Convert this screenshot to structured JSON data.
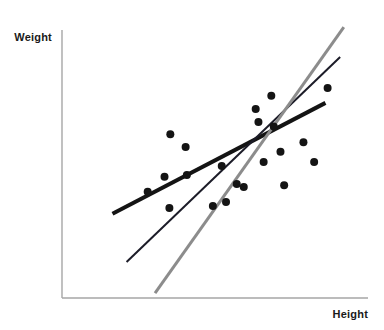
{
  "chart_data": {
    "type": "scatter",
    "title": "",
    "subtitle": "",
    "xlabel": "Height",
    "ylabel": "Weight",
    "xlim": [
      0,
      100
    ],
    "ylim": [
      0,
      100
    ],
    "grid": false,
    "legend": "none",
    "axis_ticks": {
      "x": [],
      "y": []
    },
    "axis_color": "#a6a6a6",
    "point_color": "#141414",
    "point_radius_px": 4,
    "points": [
      {
        "x": 28.0,
        "y": 39.6
      },
      {
        "x": 33.5,
        "y": 45.2
      },
      {
        "x": 35.4,
        "y": 61.1
      },
      {
        "x": 40.8,
        "y": 45.9
      },
      {
        "x": 40.4,
        "y": 56.3
      },
      {
        "x": 35.1,
        "y": 33.6
      },
      {
        "x": 49.3,
        "y": 34.3
      },
      {
        "x": 52.2,
        "y": 49.3
      },
      {
        "x": 53.6,
        "y": 35.8
      },
      {
        "x": 57.1,
        "y": 42.5
      },
      {
        "x": 59.4,
        "y": 41.4
      },
      {
        "x": 63.3,
        "y": 70.5
      },
      {
        "x": 64.2,
        "y": 65.7
      },
      {
        "x": 65.9,
        "y": 50.7
      },
      {
        "x": 68.4,
        "y": 75.5
      },
      {
        "x": 69.2,
        "y": 64.0
      },
      {
        "x": 71.4,
        "y": 54.6
      },
      {
        "x": 72.6,
        "y": 42.1
      },
      {
        "x": 78.9,
        "y": 58.1
      },
      {
        "x": 82.4,
        "y": 50.7
      },
      {
        "x": 86.8,
        "y": 78.4
      }
    ],
    "lines": [
      {
        "name": "shallow-fit-line",
        "label": "",
        "color": "#141414",
        "width_px": 4,
        "slope_rank": "shallowest",
        "start": {
          "x": 16.5,
          "y": 31.4
        },
        "end": {
          "x": 86.1,
          "y": 72.8
        }
      },
      {
        "name": "medium-fit-line",
        "label": "",
        "color": "#1c1c28",
        "width_px": 2,
        "slope_rank": "medium",
        "start": {
          "x": 21.1,
          "y": 13.4
        },
        "end": {
          "x": 90.9,
          "y": 89.9
        }
      },
      {
        "name": "steep-fit-line",
        "label": "",
        "color": "#8c8c8c",
        "width_px": 3,
        "slope_rank": "steepest",
        "start": {
          "x": 30.4,
          "y": 1.8
        },
        "end": {
          "x": 92.1,
          "y": 101.1
        }
      }
    ],
    "centroid": {
      "x": 58.7,
      "y": 52.1
    }
  },
  "axes": {
    "x_label": "Height",
    "y_label": "Weight"
  }
}
